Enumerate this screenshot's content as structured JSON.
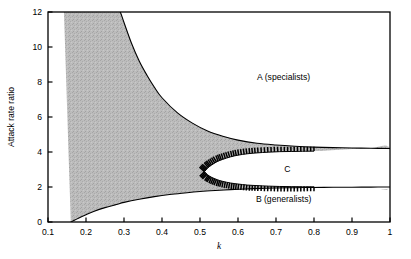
{
  "chart_data": {
    "type": "area",
    "title": "",
    "subtitle": "",
    "xlabel": "k",
    "ylabel": "Attack rate ratio",
    "xlim": [
      0.1,
      1.0
    ],
    "ylim": [
      0,
      12
    ],
    "grid": false,
    "legend_position": "none",
    "xticks": [
      0.1,
      0.2,
      0.3,
      0.4,
      0.5,
      0.6,
      0.7,
      0.8,
      0.9,
      1
    ],
    "xtick_labels": [
      "0.1",
      "0.2",
      "0.3",
      "0.4",
      "0.5",
      "0.6",
      "0.7",
      "0.8",
      "0.9",
      "1"
    ],
    "yticks": [
      0,
      2,
      4,
      6,
      8,
      10,
      12
    ],
    "ytick_labels": [
      "0",
      "2",
      "4",
      "6",
      "8",
      "10",
      "12"
    ],
    "annotations": [
      {
        "id": "A",
        "text": "A (specialists)",
        "x": 0.72,
        "y": 8.1
      },
      {
        "id": "B",
        "text": "B (generalists)",
        "x": 0.72,
        "y": 1.15
      },
      {
        "id": "C",
        "text": "C",
        "x": 0.73,
        "y": 2.85
      }
    ],
    "series": [
      {
        "name": "upper boundary",
        "role": "upper separatrix between shaded coexistence region and region A",
        "x": [
          0.1,
          0.12,
          0.14,
          0.16,
          0.18,
          0.2,
          0.22,
          0.24,
          0.26,
          0.28,
          0.29,
          0.3,
          0.32,
          0.34,
          0.36,
          0.38,
          0.4,
          0.44,
          0.48,
          0.52,
          0.56,
          0.6,
          0.65,
          0.7,
          0.75,
          0.8,
          0.85,
          0.9,
          0.95,
          1.0
        ],
        "y": [
          40.0,
          31.0,
          25.0,
          21.0,
          18.0,
          15.8,
          14.0,
          13.0,
          12.6,
          12.2,
          12.0,
          11.4,
          10.2,
          9.2,
          8.4,
          7.7,
          7.1,
          6.25,
          5.65,
          5.2,
          4.9,
          4.68,
          4.5,
          4.4,
          4.33,
          4.28,
          4.25,
          4.23,
          4.21,
          4.2
        ]
      },
      {
        "name": "lower boundary",
        "role": "lower separatrix between shaded coexistence region and region B",
        "x": [
          0.16,
          0.165,
          0.18,
          0.2,
          0.22,
          0.25,
          0.28,
          0.3,
          0.34,
          0.38,
          0.42,
          0.46,
          0.5,
          0.54,
          0.58,
          0.62,
          0.66,
          0.7,
          0.75,
          0.8,
          0.85,
          0.9,
          0.95,
          1.0
        ],
        "y": [
          0.0,
          0.05,
          0.22,
          0.42,
          0.6,
          0.82,
          1.0,
          1.12,
          1.3,
          1.45,
          1.57,
          1.66,
          1.74,
          1.8,
          1.85,
          1.89,
          1.92,
          1.94,
          1.96,
          1.975,
          1.985,
          1.99,
          1.995,
          2.0
        ]
      },
      {
        "name": "C-region upper boundary",
        "role": "hatched inner boundary, upper branch of region C lens",
        "x": [
          0.512,
          0.52,
          0.53,
          0.545,
          0.56,
          0.58,
          0.6,
          0.625,
          0.65,
          0.68,
          0.71,
          0.74,
          0.77,
          0.8
        ],
        "y": [
          2.88,
          3.08,
          3.25,
          3.45,
          3.58,
          3.72,
          3.82,
          3.9,
          3.95,
          3.99,
          4.02,
          4.03,
          4.04,
          4.05
        ]
      },
      {
        "name": "C-region lower boundary",
        "role": "hatched inner boundary, lower branch of region C lens",
        "x": [
          0.512,
          0.52,
          0.53,
          0.545,
          0.56,
          0.58,
          0.6,
          0.625,
          0.65,
          0.68,
          0.71,
          0.74,
          0.77,
          0.8
        ],
        "y": [
          2.88,
          2.7,
          2.56,
          2.42,
          2.32,
          2.23,
          2.17,
          2.11,
          2.08,
          2.05,
          2.03,
          2.02,
          2.015,
          2.01
        ]
      }
    ],
    "shaded_region_color": "#b9b9b9",
    "line_color": "#000000",
    "background_color": "#ffffff"
  }
}
